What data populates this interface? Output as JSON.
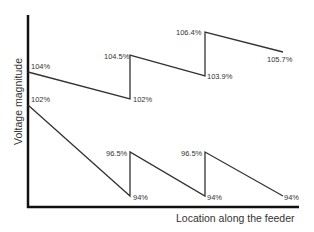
{
  "chart_data": {
    "type": "line",
    "title": "",
    "xlabel": "Location along the feeder",
    "ylabel": "Voltage magnitude",
    "grid": false,
    "legend": null,
    "series": [
      {
        "name": "upper-profile",
        "points": [
          {
            "x": 0,
            "y": 104,
            "label": "104%"
          },
          {
            "x": 1,
            "y": 102,
            "label": "102%"
          },
          {
            "x": 1,
            "y": 104.5,
            "label": "104.5%"
          },
          {
            "x": 2,
            "y": 103.9,
            "label": "103.9%"
          },
          {
            "x": 2,
            "y": 106.4,
            "label": "106.4%"
          },
          {
            "x": 3,
            "y": 105.7,
            "label": "105.7%"
          }
        ]
      },
      {
        "name": "lower-profile",
        "points": [
          {
            "x": 0,
            "y": 102,
            "label": "102%"
          },
          {
            "x": 1,
            "y": 94,
            "label": "94%"
          },
          {
            "x": 1,
            "y": 96.5,
            "label": "96.5%"
          },
          {
            "x": 2,
            "y": 94,
            "label": "94%"
          },
          {
            "x": 2,
            "y": 96.5,
            "label": "96.5%"
          },
          {
            "x": 3,
            "y": 94,
            "label": "94%"
          }
        ]
      }
    ],
    "pixel_layout": {
      "upper": [
        [
          28,
          72
        ],
        [
          130,
          99
        ],
        [
          130,
          55
        ],
        [
          205,
          76
        ],
        [
          205,
          32
        ],
        [
          283,
          52
        ]
      ],
      "lower": [
        [
          28,
          105
        ],
        [
          130,
          196
        ],
        [
          130,
          152
        ],
        [
          205,
          196
        ],
        [
          205,
          152
        ],
        [
          283,
          196
        ]
      ]
    }
  },
  "labels": {
    "u0": "104%",
    "u1": "102%",
    "u2": "104.5%",
    "u3": "103.9%",
    "u4": "106.4%",
    "u5": "105.7%",
    "l0": "102%",
    "l1": "94%",
    "l2": "96.5%",
    "l3": "94%",
    "l4": "96.5%",
    "l5": "94%"
  }
}
